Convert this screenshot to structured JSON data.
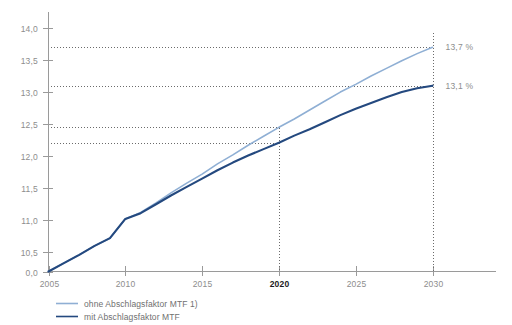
{
  "chart_data": {
    "type": "line",
    "title": "",
    "subtitle": "",
    "xlabel": "",
    "ylabel": "",
    "x": [
      2005,
      2006,
      2007,
      2008,
      2009,
      2010,
      2011,
      2012,
      2013,
      2014,
      2015,
      2016,
      2017,
      2018,
      2019,
      2020,
      2021,
      2022,
      2023,
      2024,
      2025,
      2026,
      2027,
      2028,
      2029,
      2030
    ],
    "xlim": [
      2005,
      2030
    ],
    "ylim": [
      10.2,
      14.0
    ],
    "yticks": [
      "0,0",
      "10,5",
      "11,0",
      "11,5",
      "12,0",
      "12,5",
      "13,0",
      "13,5",
      "14,0"
    ],
    "ytick_values": [
      10.2,
      10.5,
      11.0,
      11.5,
      12.0,
      12.5,
      13.0,
      13.5,
      14.0
    ],
    "xticks": [
      "2005",
      "2010",
      "2015",
      "2020",
      "2025",
      "2030"
    ],
    "xtick_values": [
      2005,
      2010,
      2015,
      2020,
      2025,
      2030
    ],
    "xtick_bold": [
      "2020"
    ],
    "grid": false,
    "legend_position": "bottom-left",
    "series": [
      {
        "name": "ohne Abschlagsfaktor MTF 1)",
        "color": "#8FAFD4",
        "width": 1.6,
        "values": [
          10.2,
          10.33,
          10.46,
          10.6,
          10.72,
          11.02,
          11.12,
          11.27,
          11.43,
          11.58,
          11.72,
          11.88,
          12.02,
          12.17,
          12.31,
          12.45,
          12.58,
          12.72,
          12.86,
          13.0,
          13.12,
          13.25,
          13.37,
          13.49,
          13.6,
          13.7
        ],
        "end_value": 13.7,
        "end_label": "13,7 %"
      },
      {
        "name": "mit Abschlagsfaktor MTF",
        "color": "#24497F",
        "width": 2.1,
        "values": [
          10.2,
          10.33,
          10.46,
          10.6,
          10.72,
          11.02,
          11.11,
          11.25,
          11.39,
          11.52,
          11.65,
          11.78,
          11.9,
          12.01,
          12.11,
          12.21,
          12.32,
          12.42,
          12.53,
          12.64,
          12.74,
          12.83,
          12.92,
          13.0,
          13.06,
          13.1
        ],
        "end_value": 13.1,
        "end_label": "13,1 %"
      }
    ],
    "reference_lines": [
      {
        "name": "hline-13-7",
        "orientation": "horizontal",
        "value": 13.7,
        "label": "13,7 %",
        "extent": "full"
      },
      {
        "name": "hline-13-1",
        "orientation": "horizontal",
        "value": 13.1,
        "label": "13,1 %",
        "extent": "full"
      },
      {
        "name": "hline-12-45",
        "orientation": "horizontal",
        "value": 12.45,
        "label": "",
        "extent": "to-2020"
      },
      {
        "name": "hline-12-2",
        "orientation": "horizontal",
        "value": 12.21,
        "label": "",
        "extent": "to-2020"
      },
      {
        "name": "vline-2020",
        "orientation": "vertical",
        "value": 2020,
        "label": "2020",
        "extent": "to-series-1"
      },
      {
        "name": "vline-2030",
        "orientation": "vertical",
        "value": 2030,
        "label": "2030",
        "extent": "full"
      }
    ],
    "annotations": [
      {
        "name": "end-label-upper",
        "text": "13,7 %",
        "x": 2030,
        "y": 13.7
      },
      {
        "name": "end-label-lower",
        "text": "13,1 %",
        "x": 2030,
        "y": 13.1
      }
    ],
    "colors": {
      "background": "#ffffff",
      "axis": "#9a9a9a",
      "tick_text": "#8d8d8d",
      "bold_tick_text": "#1a1a1a",
      "dotted": "#6b6b6b",
      "legend_text": "#6f6f6f",
      "series_light": "#8FAFD4",
      "series_dark": "#24497F"
    }
  },
  "legend": {
    "items": [
      {
        "label": "ohne Abschlagsfaktor MTF 1)",
        "color": "#8FAFD4"
      },
      {
        "label": "mit Abschlagsfaktor MTF",
        "color": "#24497F"
      }
    ]
  }
}
